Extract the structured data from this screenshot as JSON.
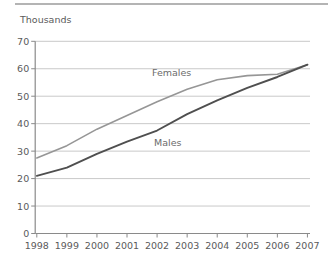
{
  "chart_data": {
    "type": "line",
    "title": "",
    "ylabel": "Thousands",
    "xlabel": "",
    "categories": [
      "1998",
      "1999",
      "2000",
      "2001",
      "2002",
      "2003",
      "2004",
      "2005",
      "2006",
      "2007"
    ],
    "series": [
      {
        "name": "Females",
        "color": "#969696",
        "values": [
          27.5,
          32,
          38,
          43,
          48,
          52.5,
          56,
          57.5,
          58,
          61.5
        ]
      },
      {
        "name": "Males",
        "color": "#4f4f4f",
        "values": [
          21,
          24,
          29,
          33.5,
          37.5,
          43.5,
          48.5,
          53,
          57,
          61.5
        ]
      }
    ],
    "ylim": [
      0,
      70
    ],
    "yticks": [
      0,
      10,
      20,
      30,
      40,
      50,
      60,
      70
    ],
    "ytick_step": 10,
    "grid": true,
    "legend_position": "inline-annotations",
    "colors": {
      "gridline": "#c9c9c9",
      "axis": "#8a8a8a",
      "tick_text": "#5a5a5a",
      "top_border": "#b4b4b4",
      "background": "#ffffff"
    }
  }
}
